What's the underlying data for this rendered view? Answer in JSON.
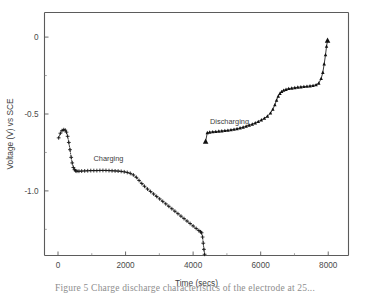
{
  "figure": {
    "caption": "Figure 5  Charge discharge characteristics of the electrode at 25..."
  },
  "chart_data": {
    "type": "line",
    "title": "",
    "xlabel": "Time (secs)",
    "ylabel": "Voltage (V) vs SCE",
    "xlim": [
      -400,
      8600
    ],
    "ylim": [
      -1.42,
      0.16
    ],
    "grid": false,
    "legend_position": "none",
    "xticks": [
      0,
      2000,
      4000,
      6000,
      8000
    ],
    "xtick_labels": [
      "0",
      "2000",
      "4000",
      "6000",
      "8000"
    ],
    "xticks_minor": [
      1000,
      3000,
      5000,
      7000
    ],
    "yticks": [
      0,
      -0.5,
      -1.0
    ],
    "ytick_labels": [
      "0",
      "-0.5",
      "-1.0"
    ],
    "yticks_minor": [
      -0.25,
      -0.75,
      -1.25
    ],
    "annotations": [
      {
        "text": "Charging",
        "x": 1050,
        "y": -0.805
      },
      {
        "text": "Discharging",
        "x": 4500,
        "y": -0.565
      }
    ],
    "series": [
      {
        "name": "Charging",
        "marker": "plus",
        "linestyle": "dotted",
        "x": [
          20,
          70,
          120,
          170,
          215,
          250,
          285,
          320,
          355,
          390,
          420,
          455,
          490,
          520,
          560,
          620,
          700,
          790,
          880,
          970,
          1060,
          1150,
          1240,
          1330,
          1420,
          1510,
          1600,
          1690,
          1780,
          1870,
          1960,
          2050,
          2140,
          2230,
          2320,
          2400,
          2480,
          2560,
          2650,
          2740,
          2830,
          2920,
          3010,
          3100,
          3190,
          3280,
          3370,
          3460,
          3550,
          3640,
          3730,
          3820,
          3910,
          4000,
          4090,
          4170,
          4220,
          4250,
          4280,
          4300,
          4320,
          4340
        ],
        "y": [
          -0.655,
          -0.625,
          -0.608,
          -0.602,
          -0.605,
          -0.618,
          -0.645,
          -0.685,
          -0.732,
          -0.782,
          -0.818,
          -0.848,
          -0.862,
          -0.869,
          -0.872,
          -0.872,
          -0.871,
          -0.87,
          -0.869,
          -0.868,
          -0.868,
          -0.868,
          -0.867,
          -0.867,
          -0.867,
          -0.868,
          -0.869,
          -0.87,
          -0.871,
          -0.873,
          -0.876,
          -0.88,
          -0.886,
          -0.896,
          -0.912,
          -0.932,
          -0.952,
          -0.97,
          -0.988,
          -1.004,
          -1.02,
          -1.036,
          -1.052,
          -1.068,
          -1.084,
          -1.1,
          -1.116,
          -1.132,
          -1.148,
          -1.164,
          -1.18,
          -1.196,
          -1.212,
          -1.228,
          -1.244,
          -1.258,
          -1.266,
          -1.272,
          -1.3,
          -1.34,
          -1.38,
          -1.412
        ]
      },
      {
        "name": "Discharging",
        "marker": "triangle",
        "linestyle": "solid",
        "x": [
          4370,
          4420,
          4490,
          4580,
          4670,
          4760,
          4850,
          4940,
          5030,
          5120,
          5210,
          5300,
          5390,
          5480,
          5570,
          5660,
          5750,
          5840,
          5930,
          6020,
          6110,
          6200,
          6290,
          6360,
          6420,
          6470,
          6520,
          6570,
          6620,
          6680,
          6750,
          6830,
          6920,
          7010,
          7100,
          7190,
          7280,
          7370,
          7460,
          7550,
          7640,
          7720,
          7790,
          7840,
          7880,
          7920,
          7950,
          7980
        ],
        "y": [
          -0.678,
          -0.622,
          -0.618,
          -0.616,
          -0.614,
          -0.612,
          -0.61,
          -0.608,
          -0.606,
          -0.603,
          -0.6,
          -0.596,
          -0.591,
          -0.586,
          -0.58,
          -0.573,
          -0.566,
          -0.558,
          -0.549,
          -0.539,
          -0.528,
          -0.514,
          -0.494,
          -0.47,
          -0.44,
          -0.41,
          -0.384,
          -0.366,
          -0.354,
          -0.346,
          -0.34,
          -0.335,
          -0.332,
          -0.329,
          -0.326,
          -0.324,
          -0.322,
          -0.32,
          -0.318,
          -0.315,
          -0.31,
          -0.3,
          -0.27,
          -0.23,
          -0.175,
          -0.115,
          -0.06,
          -0.022
        ]
      }
    ]
  },
  "axes": {
    "y_title": "Voltage (V) vs SCE",
    "x_title": "Time (secs)"
  }
}
